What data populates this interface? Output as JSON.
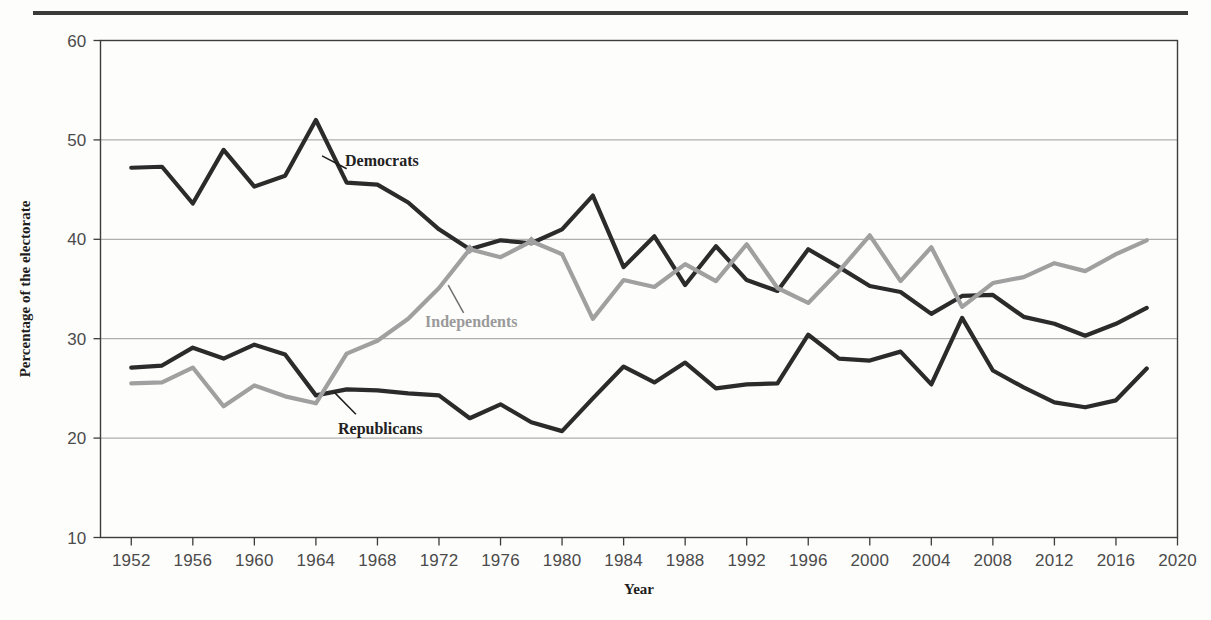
{
  "figure": {
    "name": "party-identification-line-chart",
    "top_rule": true
  },
  "chart_data": {
    "type": "line",
    "title": "",
    "xlabel": "Year",
    "ylabel": "Percentage of the electorate",
    "xlim": [
      1950,
      2020
    ],
    "ylim": [
      10,
      60
    ],
    "xticks": [
      1952,
      1956,
      1960,
      1964,
      1968,
      1972,
      1976,
      1980,
      1984,
      1988,
      1992,
      1996,
      2000,
      2004,
      2008,
      2012,
      2016,
      2020
    ],
    "yticks": [
      10,
      20,
      30,
      40,
      50,
      60
    ],
    "grid": "horizontal",
    "legend": "inline-annotations",
    "x": [
      1952,
      1954,
      1956,
      1958,
      1960,
      1962,
      1964,
      1966,
      1968,
      1970,
      1972,
      1974,
      1976,
      1978,
      1980,
      1982,
      1984,
      1986,
      1988,
      1990,
      1992,
      1994,
      1996,
      1998,
      2000,
      2002,
      2004,
      2006,
      2008,
      2010,
      2012,
      2014,
      2016,
      2018
    ],
    "series": [
      {
        "name": "Democrats",
        "color": "#2b2b2b",
        "label_x": 1966,
        "label_y": 47.2,
        "values": [
          47.2,
          47.3,
          43.6,
          49.0,
          45.3,
          46.4,
          52.0,
          45.7,
          45.5,
          43.7,
          41.0,
          39.0,
          39.9,
          39.6,
          41.0,
          44.4,
          37.2,
          40.3,
          35.4,
          39.3,
          35.9,
          34.8,
          39.0,
          37.2,
          35.3,
          34.7,
          32.5,
          34.3,
          34.4,
          32.2,
          31.5,
          30.3,
          31.5,
          33.1
        ]
      },
      {
        "name": "Republicans",
        "color": "#2b2b2b",
        "label_x": 1967,
        "label_y": 21.5,
        "values": [
          27.1,
          27.3,
          29.1,
          28.0,
          29.4,
          28.4,
          24.3,
          24.9,
          24.8,
          24.5,
          24.3,
          22.0,
          23.4,
          21.6,
          20.7,
          24.0,
          27.2,
          25.6,
          27.6,
          25.0,
          25.4,
          25.5,
          30.4,
          28.0,
          27.8,
          28.7,
          25.4,
          32.1,
          26.8,
          25.1,
          23.6,
          23.1,
          23.8,
          27.0
        ]
      },
      {
        "name": "Independents",
        "color": "#a0a0a0",
        "label_x": 1974,
        "label_y": 31.5,
        "values": [
          25.5,
          25.6,
          27.1,
          23.2,
          25.3,
          24.2,
          23.5,
          28.5,
          29.8,
          32.0,
          35.1,
          39.0,
          38.2,
          39.8,
          38.5,
          32.0,
          35.9,
          35.2,
          37.5,
          35.8,
          39.5,
          35.1,
          33.6,
          36.8,
          40.4,
          35.8,
          39.2,
          33.2,
          35.6,
          36.2,
          37.6,
          36.8,
          38.5,
          39.9
        ]
      }
    ],
    "crossover_markers": [
      {
        "x": 1974,
        "y": 39.0
      },
      {
        "x": 1978,
        "y": 39.8
      }
    ],
    "annotations": [
      {
        "text": "Democrats",
        "series": "Democrats",
        "leader_from": [
          1964.4,
          48.4
        ],
        "leader_to": [
          1966.0,
          47.1
        ]
      },
      {
        "text": "Republicans",
        "series": "Republicans",
        "leader_from": [
          1965.2,
          24.6
        ],
        "leader_to": [
          1966.6,
          22.4
        ]
      },
      {
        "text": "Independents",
        "series": "Independents",
        "leader_from": [
          1972.6,
          35.4
        ],
        "leader_to": [
          1973.6,
          32.6
        ]
      }
    ]
  },
  "colors": {
    "dark_line": "#2b2b2b",
    "gray_line": "#a0a0a0",
    "grid": "#9c9c9c",
    "frame": "#3c3c3c",
    "tick_text": "#4b4b4b",
    "title_text": "#1d1d1d",
    "rule": "#3a3a3a",
    "background": "#fdfdfc"
  }
}
